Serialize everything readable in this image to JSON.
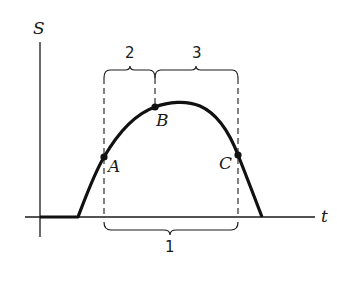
{
  "diagram": {
    "axes": {
      "y_label": "S",
      "x_label": "t"
    },
    "points": [
      {
        "label": "A",
        "x": 104,
        "y": 157
      },
      {
        "label": "B",
        "x": 155,
        "y": 107
      },
      {
        "label": "C",
        "x": 238,
        "y": 155
      }
    ],
    "intervals": [
      {
        "label": "1",
        "from": "A",
        "to": "C",
        "position": "below axis"
      },
      {
        "label": "2",
        "from": "A",
        "to": "B",
        "position": "above"
      },
      {
        "label": "3",
        "from": "B",
        "to": "C",
        "position": "above"
      }
    ],
    "colors": {
      "ink": "#1a1a1a",
      "background": "#ffffff"
    }
  }
}
